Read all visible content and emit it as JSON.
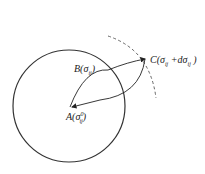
{
  "diagram": {
    "circle": {
      "cx": 69,
      "cy": 106,
      "r": 56,
      "stroke": "#333333"
    },
    "dashed_arc": {
      "stroke": "#555555",
      "description": "yield surface (dashed)"
    },
    "points": {
      "A": {
        "label": "A(σ",
        "sub": "ij",
        "sup": "0",
        "close": ")"
      },
      "B": {
        "label": "B(σ",
        "sub": "ij",
        "close": ")"
      },
      "C": {
        "label": "C(σ",
        "sub": "ij",
        "mid": " +dσ",
        "sub2": "ij",
        "close": " )"
      }
    }
  }
}
